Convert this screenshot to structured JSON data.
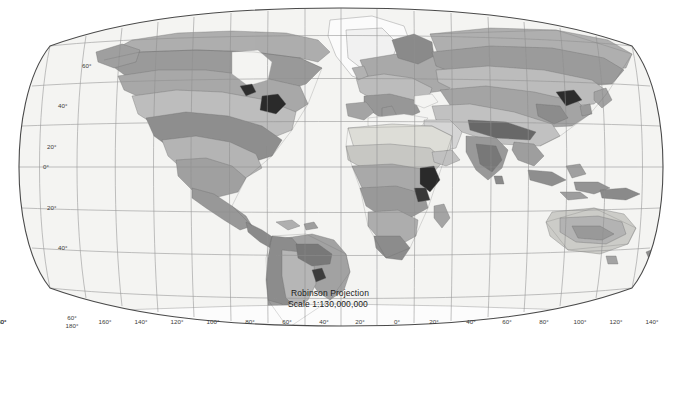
{
  "map": {
    "title_lines": {
      "projection": "Robinson Projection",
      "scale": "Scale 1:130,000,000"
    },
    "projection_name": "Robinson Projection",
    "scale_text": "Scale 1:130,000,000",
    "ocean_color": "#f4f4f2",
    "graticule_color": "#8c8c8c",
    "border_color": "#555555",
    "longitude_labels": [
      "180°",
      "160°",
      "140°",
      "120°",
      "100°",
      "80°",
      "60°",
      "40°",
      "20°",
      "0°",
      "20°",
      "40°",
      "60°",
      "80°",
      "100°",
      "120°",
      "140°",
      "160°",
      "180°"
    ],
    "latitude_labels_left": [
      "60°",
      "40°",
      "20°",
      "0°",
      "20°",
      "40°",
      "60°"
    ],
    "corner_label_bottom_left": "180°",
    "corner_label_bottom_left_upper": "60°"
  },
  "legend": {
    "title": "Soil Orders",
    "columns": [
      {
        "items": [
          {
            "label": "Alfisols",
            "color": "#b9b9b9"
          },
          {
            "label": "Andisols",
            "color": "#6d6d6d"
          },
          {
            "label": "Aridisols",
            "color": "#e8e8e8"
          }
        ]
      },
      {
        "items": [
          {
            "label": "Entisols",
            "color": "#c4c4c4"
          },
          {
            "label": "Gelisols",
            "color": "#ababab"
          },
          {
            "label": "Histosols",
            "color": "#1c1c1c"
          }
        ]
      },
      {
        "items": [
          {
            "label": "Inceptisols",
            "color": "#cfcfcf"
          },
          {
            "label": "Mollisols",
            "color": "#7a7a7a"
          },
          {
            "label": "Oxisols",
            "color": "#9d9d9d"
          }
        ]
      },
      {
        "items": [
          {
            "label": "Spodosols",
            "color": "#bcbcbc"
          },
          {
            "label": "Ultisols",
            "color": "#dcdcdc"
          },
          {
            "label": "Vertisols",
            "color": "#3a3a3a"
          }
        ]
      },
      {
        "items": [
          {
            "label": "Rocky Land",
            "color": "#5a5a5a"
          },
          {
            "label": "Shifting Land",
            "color": "#c9c9c9"
          },
          {
            "label": "Ice/Glacier",
            "color": "#ffffff"
          }
        ]
      }
    ]
  }
}
